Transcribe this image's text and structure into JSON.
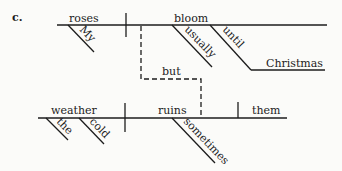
{
  "diagram": {
    "type": "sentence-diagram",
    "label": "c.",
    "sentence_text": "My roses usually bloom until Christmas, but cold weather sometimes ruins them.",
    "clause1": {
      "subject": "roses",
      "subject_modifiers": [
        "My"
      ],
      "verb": "bloom",
      "verb_modifiers": [
        "usually"
      ],
      "preposition": "until",
      "prep_object": "Christmas"
    },
    "conjunction": "but",
    "clause2": {
      "subject": "weather",
      "subject_modifiers": [
        "the",
        "cold"
      ],
      "verb": "ruins",
      "verb_modifiers": [
        "sometimes"
      ],
      "object": "them"
    },
    "colors": {
      "ink": "#1c1c1c",
      "paper": "#fbfbf9"
    }
  }
}
